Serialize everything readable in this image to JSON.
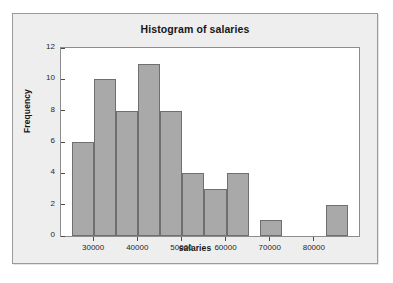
{
  "chart_data": {
    "type": "bar",
    "title": "Histogram of salaries",
    "xlabel": "salaries",
    "ylabel": "Frequency",
    "grid": false,
    "legend": "none",
    "xlim": [
      22500,
      90000
    ],
    "ylim": [
      0,
      12
    ],
    "bin_width": 5000,
    "xticks": [
      30000,
      40000,
      50000,
      60000,
      70000,
      80000
    ],
    "xtick_labels": [
      "30000",
      "40000",
      "50000",
      "60000",
      "70000",
      "80000"
    ],
    "yticks": [
      0,
      2,
      4,
      6,
      8,
      10,
      12
    ],
    "ytick_labels": [
      "0",
      "2",
      "4",
      "6",
      "8",
      "10",
      "12"
    ],
    "bins": [
      {
        "left": 25000,
        "right": 30000,
        "value": 6
      },
      {
        "left": 30000,
        "right": 35000,
        "value": 10
      },
      {
        "left": 35000,
        "right": 40000,
        "value": 8
      },
      {
        "left": 40000,
        "right": 45000,
        "value": 11
      },
      {
        "left": 45000,
        "right": 50000,
        "value": 8
      },
      {
        "left": 50000,
        "right": 55000,
        "value": 4
      },
      {
        "left": 55000,
        "right": 60000,
        "value": 3
      },
      {
        "left": 60000,
        "right": 65000,
        "value": 4
      },
      {
        "left": 67500,
        "right": 72500,
        "value": 1
      },
      {
        "left": 82500,
        "right": 87500,
        "value": 2
      }
    ],
    "categories": [
      "25000-30000",
      "30000-35000",
      "35000-40000",
      "40000-45000",
      "45000-50000",
      "50000-55000",
      "55000-60000",
      "60000-65000",
      "67500-72500",
      "82500-87500"
    ],
    "values": [
      6,
      10,
      8,
      11,
      8,
      4,
      3,
      4,
      1,
      2
    ],
    "colors": {
      "bar_fill": "#a9a9a9",
      "bar_edge": "#6f6f6f",
      "panel_background": "#ffffff",
      "panel_border": "#8c8c8c",
      "frame_background": "#eeeeee",
      "frame_border": "#9a9a9a",
      "text": "#171717",
      "tick": "#4a4a4a"
    }
  }
}
